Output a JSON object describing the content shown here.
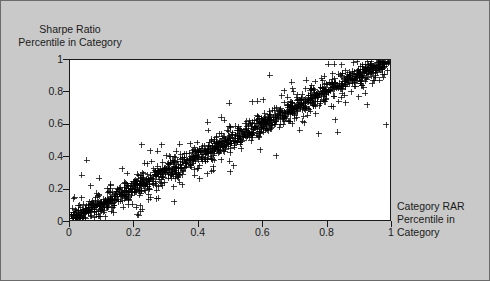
{
  "figure": {
    "background_color": "#c9c9c9",
    "plot_background_color": "#ffffff",
    "border_color": "#6b6b6b",
    "axis_color": "#1a1a1a",
    "marker_color": "#000000"
  },
  "chart_data": {
    "type": "scatter",
    "title": "",
    "xlabel": "Category RAR\nPercentile in\nCategory",
    "ylabel": "Sharpe Ratio\nPercentile in Category",
    "xlim": [
      0,
      1
    ],
    "ylim": [
      0,
      1
    ],
    "grid": false,
    "legend": null,
    "marker": "+",
    "marker_size": 3,
    "xticks": [
      0,
      0.2,
      0.4,
      0.6,
      0.8,
      1
    ],
    "xtick_labels": [
      "0",
      "0.2",
      "0.4",
      "0.6",
      "0.8",
      "1"
    ],
    "yticks": [
      0,
      0.2,
      0.4,
      0.6,
      0.8,
      1
    ],
    "ytick_labels": [
      "0",
      "0.2",
      "0.4",
      "0.6",
      "0.8",
      "1"
    ],
    "n_points": 1500,
    "relationship": {
      "slope": 1.0,
      "intercept": 0.0,
      "noise_sd": 0.035,
      "correlation": 0.98
    },
    "points": [
      [
        0.012,
        0.018
      ],
      [
        0.021,
        0.015
      ],
      [
        0.028,
        0.034
      ],
      [
        0.035,
        0.029
      ],
      [
        0.041,
        0.052
      ],
      [
        0.048,
        0.043
      ],
      [
        0.055,
        0.061
      ],
      [
        0.062,
        0.058
      ],
      [
        0.07,
        0.079
      ],
      [
        0.077,
        0.068
      ],
      [
        0.084,
        0.096
      ],
      [
        0.091,
        0.088
      ],
      [
        0.098,
        0.112
      ],
      [
        0.105,
        0.101
      ],
      [
        0.112,
        0.124
      ],
      [
        0.119,
        0.118
      ],
      [
        0.126,
        0.141
      ],
      [
        0.133,
        0.129
      ],
      [
        0.14,
        0.152
      ],
      [
        0.148,
        0.146
      ],
      [
        0.155,
        0.168
      ],
      [
        0.162,
        0.159
      ],
      [
        0.169,
        0.181
      ],
      [
        0.176,
        0.173
      ],
      [
        0.183,
        0.196
      ],
      [
        0.19,
        0.188
      ],
      [
        0.197,
        0.209
      ],
      [
        0.204,
        0.201
      ],
      [
        0.211,
        0.224
      ],
      [
        0.218,
        0.215
      ],
      [
        0.226,
        0.237
      ],
      [
        0.233,
        0.229
      ],
      [
        0.24,
        0.251
      ],
      [
        0.247,
        0.243
      ],
      [
        0.254,
        0.265
      ],
      [
        0.261,
        0.258
      ],
      [
        0.268,
        0.279
      ],
      [
        0.275,
        0.271
      ],
      [
        0.282,
        0.293
      ],
      [
        0.289,
        0.286
      ],
      [
        0.296,
        0.307
      ],
      [
        0.304,
        0.299
      ],
      [
        0.311,
        0.321
      ],
      [
        0.318,
        0.314
      ],
      [
        0.325,
        0.335
      ],
      [
        0.332,
        0.328
      ],
      [
        0.339,
        0.349
      ],
      [
        0.346,
        0.342
      ],
      [
        0.353,
        0.363
      ],
      [
        0.36,
        0.356
      ],
      [
        0.367,
        0.377
      ],
      [
        0.374,
        0.37
      ],
      [
        0.382,
        0.391
      ],
      [
        0.389,
        0.384
      ],
      [
        0.396,
        0.405
      ],
      [
        0.403,
        0.398
      ],
      [
        0.41,
        0.419
      ],
      [
        0.417,
        0.412
      ],
      [
        0.424,
        0.433
      ],
      [
        0.431,
        0.426
      ],
      [
        0.438,
        0.447
      ],
      [
        0.445,
        0.44
      ],
      [
        0.452,
        0.461
      ],
      [
        0.46,
        0.454
      ],
      [
        0.467,
        0.475
      ],
      [
        0.474,
        0.468
      ],
      [
        0.481,
        0.489
      ],
      [
        0.488,
        0.482
      ],
      [
        0.495,
        0.503
      ],
      [
        0.502,
        0.496
      ],
      [
        0.509,
        0.517
      ],
      [
        0.516,
        0.51
      ],
      [
        0.523,
        0.531
      ],
      [
        0.53,
        0.524
      ],
      [
        0.538,
        0.545
      ],
      [
        0.545,
        0.538
      ],
      [
        0.552,
        0.559
      ],
      [
        0.559,
        0.552
      ],
      [
        0.566,
        0.573
      ],
      [
        0.573,
        0.566
      ],
      [
        0.58,
        0.587
      ],
      [
        0.587,
        0.58
      ],
      [
        0.594,
        0.601
      ],
      [
        0.601,
        0.594
      ],
      [
        0.608,
        0.615
      ],
      [
        0.616,
        0.609
      ],
      [
        0.623,
        0.629
      ],
      [
        0.63,
        0.623
      ],
      [
        0.637,
        0.643
      ],
      [
        0.644,
        0.637
      ],
      [
        0.651,
        0.657
      ],
      [
        0.658,
        0.651
      ],
      [
        0.665,
        0.671
      ],
      [
        0.672,
        0.665
      ],
      [
        0.679,
        0.685
      ],
      [
        0.686,
        0.679
      ],
      [
        0.694,
        0.699
      ],
      [
        0.701,
        0.693
      ],
      [
        0.708,
        0.713
      ],
      [
        0.715,
        0.707
      ],
      [
        0.722,
        0.727
      ],
      [
        0.729,
        0.721
      ],
      [
        0.736,
        0.741
      ],
      [
        0.743,
        0.735
      ],
      [
        0.75,
        0.755
      ],
      [
        0.757,
        0.749
      ],
      [
        0.764,
        0.769
      ],
      [
        0.772,
        0.763
      ],
      [
        0.779,
        0.783
      ],
      [
        0.786,
        0.777
      ],
      [
        0.793,
        0.797
      ],
      [
        0.8,
        0.791
      ],
      [
        0.807,
        0.811
      ],
      [
        0.814,
        0.805
      ],
      [
        0.821,
        0.825
      ],
      [
        0.828,
        0.819
      ],
      [
        0.835,
        0.839
      ],
      [
        0.842,
        0.833
      ],
      [
        0.85,
        0.853
      ],
      [
        0.857,
        0.847
      ],
      [
        0.864,
        0.867
      ],
      [
        0.871,
        0.861
      ],
      [
        0.878,
        0.881
      ],
      [
        0.885,
        0.875
      ],
      [
        0.892,
        0.895
      ],
      [
        0.899,
        0.889
      ],
      [
        0.906,
        0.909
      ],
      [
        0.913,
        0.903
      ],
      [
        0.92,
        0.923
      ],
      [
        0.928,
        0.917
      ],
      [
        0.935,
        0.937
      ],
      [
        0.942,
        0.931
      ],
      [
        0.949,
        0.951
      ],
      [
        0.956,
        0.945
      ],
      [
        0.963,
        0.965
      ],
      [
        0.97,
        0.959
      ],
      [
        0.977,
        0.979
      ],
      [
        0.984,
        0.973
      ],
      [
        0.991,
        0.993
      ],
      [
        0.997,
        0.987
      ]
    ]
  }
}
